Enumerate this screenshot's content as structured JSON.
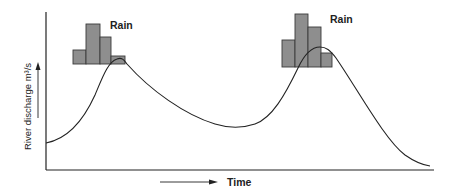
{
  "diagram": {
    "y_axis_label": "River discharge m³/s",
    "x_axis_label": "Time",
    "rain_label_1": "Rain",
    "rain_label_2": "Rain",
    "colors": {
      "bars": "#8e8e8e",
      "bar_stroke": "#3a3a3a",
      "lines": "#222222",
      "background": "#ffffff"
    },
    "rain_events": [
      {
        "label": "Rain",
        "bars_relative_heights": [
          1,
          3,
          2,
          0.5
        ]
      },
      {
        "label": "Rain",
        "bars_relative_heights": [
          2,
          4,
          3,
          1
        ]
      }
    ],
    "hydrograph": {
      "description": "Discharge rises after each rainfall event, peaks with a lag, then recedes",
      "peaks": 2
    }
  }
}
